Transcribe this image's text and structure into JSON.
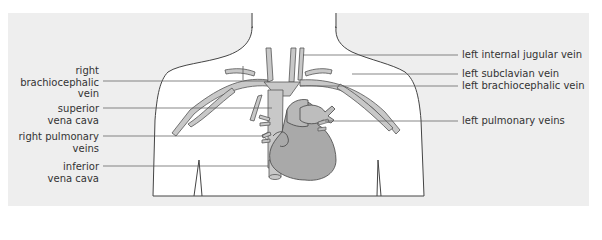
{
  "diagram": {
    "labels_left": [
      {
        "id": "right-brachiocephalic-vein",
        "lines": [
          "right",
          "brachiocephalic",
          "vein"
        ]
      },
      {
        "id": "superior-vena-cava",
        "lines": [
          "superior",
          "vena cava"
        ]
      },
      {
        "id": "right-pulmonary-veins",
        "lines": [
          "right pulmonary",
          "veins"
        ]
      },
      {
        "id": "inferior-vena-cava",
        "lines": [
          "inferior",
          "vena cava"
        ]
      }
    ],
    "labels_right": [
      {
        "id": "left-internal-jugular-vein",
        "text": "left internal jugular vein"
      },
      {
        "id": "left-subclavian-vein",
        "text": "left subclavian vein"
      },
      {
        "id": "left-brachiocephalic-vein",
        "text": "left brachiocephalic vein"
      },
      {
        "id": "left-pulmonary-veins",
        "text": "left pulmonary veins"
      }
    ],
    "colors": {
      "panel_bg": "#eeeeee",
      "body_fill": "#ffffff",
      "outline": "#444444",
      "vein_fill": "#c8c8c8",
      "heart_fill": "#a9a9a9",
      "leader_line": "#555555",
      "text": "#333333"
    }
  }
}
